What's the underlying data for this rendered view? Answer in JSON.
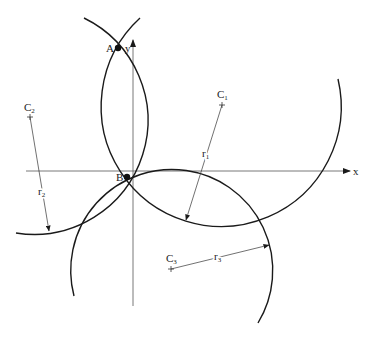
{
  "diagram": {
    "type": "geometry",
    "axes": {
      "x_label": "x",
      "y_label": "y"
    },
    "points": {
      "A": {
        "label": "A"
      },
      "B": {
        "label": "B"
      }
    },
    "centers": [
      {
        "id": "C1",
        "label": "C",
        "sub": "1",
        "radius_label": "r",
        "radius_sub": "1"
      },
      {
        "id": "C2",
        "label": "C",
        "sub": "2",
        "radius_label": "r",
        "radius_sub": "2"
      },
      {
        "id": "C3",
        "label": "C",
        "sub": "3",
        "radius_label": "r",
        "radius_sub": "3"
      }
    ],
    "colors": {
      "stroke": "#1a1a1a",
      "axis": "#555555",
      "background": "#ffffff"
    }
  }
}
